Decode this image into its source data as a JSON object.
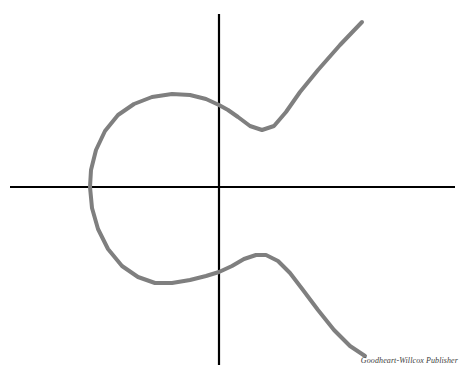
{
  "figure": {
    "type": "graph",
    "background_color": "#ffffff",
    "width": 469,
    "height": 383,
    "credit": "Goodheart-Willcox Publisher"
  },
  "chart_data": {
    "type": "line",
    "title": "",
    "subtitle": "",
    "xlabel": "",
    "ylabel": "",
    "grid": false,
    "legend": null,
    "tick_labels": {
      "x": [],
      "y": []
    },
    "axes": {
      "color": "#000000",
      "line_width": 2,
      "x_axis": {
        "orientation": "horizontal",
        "pixel_y": 187,
        "pixel_x_start": 10,
        "pixel_x_end": 455,
        "arrowheads": false
      },
      "y_axis": {
        "orientation": "vertical",
        "pixel_x": 219,
        "pixel_y_start": 14,
        "pixel_y_end": 365,
        "arrowheads": false
      },
      "origin": [
        219,
        187
      ]
    },
    "series": [
      {
        "name": "cubic-curve",
        "color": "#7f7f7f",
        "line_width": 4,
        "closed": false,
        "description": "Continuous S-shaped cubic curve looping leftward around the origin",
        "points": [
          [
            362,
            22
          ],
          [
            340,
            45
          ],
          [
            318,
            70
          ],
          [
            300,
            92
          ],
          [
            286,
            112
          ],
          [
            274,
            126
          ],
          [
            262,
            130
          ],
          [
            250,
            126
          ],
          [
            238,
            117
          ],
          [
            228,
            110
          ],
          [
            219,
            105
          ],
          [
            206,
            99
          ],
          [
            190,
            95
          ],
          [
            172,
            94
          ],
          [
            152,
            97
          ],
          [
            134,
            104
          ],
          [
            118,
            115
          ],
          [
            105,
            131
          ],
          [
            96,
            150
          ],
          [
            91,
            170
          ],
          [
            90,
            187
          ],
          [
            92,
            208
          ],
          [
            98,
            229
          ],
          [
            108,
            249
          ],
          [
            122,
            266
          ],
          [
            138,
            277
          ],
          [
            155,
            283
          ],
          [
            172,
            283
          ],
          [
            190,
            280
          ],
          [
            206,
            276
          ],
          [
            219,
            272
          ],
          [
            232,
            266
          ],
          [
            244,
            259
          ],
          [
            256,
            255
          ],
          [
            266,
            255
          ],
          [
            278,
            261
          ],
          [
            290,
            273
          ],
          [
            303,
            290
          ],
          [
            318,
            310
          ],
          [
            334,
            330
          ],
          [
            350,
            346
          ],
          [
            365,
            356
          ]
        ],
        "key_features": {
          "left_extremum": [
            90,
            187
          ],
          "upper_local_min": [
            266,
            129
          ],
          "lower_local_max": [
            264,
            255
          ],
          "y_axis_crossing_upper": [
            219,
            105
          ],
          "y_axis_crossing_lower": [
            219,
            272
          ],
          "x_axis_crossing_left": [
            90,
            187
          ],
          "upper_terminus": [
            362,
            22
          ],
          "lower_terminus": [
            365,
            356
          ]
        }
      }
    ]
  }
}
